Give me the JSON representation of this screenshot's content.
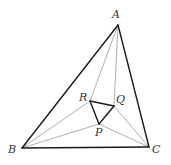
{
  "diagram": {
    "type": "geometry",
    "colors": {
      "thick": "#1a1a1a",
      "thin": "#9a9a9a",
      "label": "#333333"
    },
    "points": {
      "A": {
        "label": "A",
        "x": 118,
        "y": 25,
        "lx": 112,
        "ly": 18
      },
      "B": {
        "label": "B",
        "x": 22,
        "y": 148,
        "lx": 8,
        "ly": 153
      },
      "C": {
        "label": "C",
        "x": 149,
        "y": 147,
        "lx": 152,
        "ly": 153
      },
      "R": {
        "label": "R",
        "x": 90,
        "y": 101,
        "lx": 79,
        "ly": 101
      },
      "Q": {
        "label": "Q",
        "x": 114,
        "y": 106,
        "lx": 116,
        "ly": 103
      },
      "P": {
        "label": "P",
        "x": 99,
        "y": 124,
        "lx": 95,
        "ly": 136
      }
    },
    "thick_segments": [
      [
        "A",
        "B"
      ],
      [
        "B",
        "C"
      ],
      [
        "C",
        "A"
      ],
      [
        "P",
        "Q"
      ],
      [
        "Q",
        "R"
      ],
      [
        "R",
        "P"
      ]
    ],
    "thin_segments": [
      [
        "A",
        "R"
      ],
      [
        "A",
        "Q"
      ],
      [
        "B",
        "R"
      ],
      [
        "B",
        "P"
      ],
      [
        "C",
        "P"
      ],
      [
        "C",
        "Q"
      ]
    ]
  }
}
